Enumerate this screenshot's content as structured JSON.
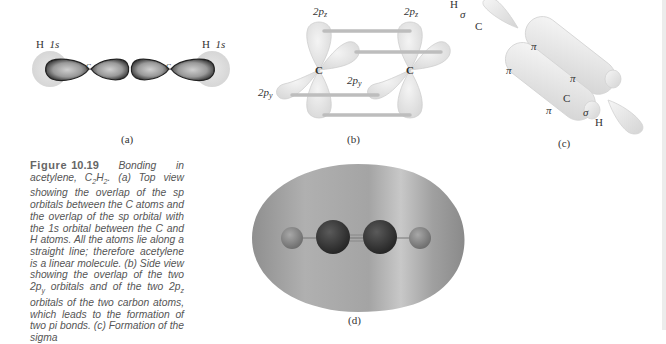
{
  "figure": {
    "number": "10.19",
    "label": "Figure",
    "caption_text": "Bonding in acetylene, C2H2. (a) Top view showing the overlap of the sp orbitals between the C atoms and the overlap of the sp orbital with the 1s orbital between the C and H atoms. All the atoms lie along a straight line; therefore acetylene is a linear molecule. (b) Side view showing the overlap of the two 2py orbitals and of the two 2pz orbitals of the two carbon atoms, which leads to the formation of two pi bonds. (c) Formation of the sigma",
    "caption_parts": {
      "intro": "Bonding in acetylene, ",
      "formula_c": "C",
      "formula_c_sub": "2",
      "formula_h": "H",
      "formula_h_sub": "2",
      "rest": ". (a) Top view showing the overlap of the sp orbitals between the C atoms and the overlap of the sp orbital with the 1s orbital between the C and H atoms. All the atoms lie along a straight line; therefore acetylene is a linear molecule. (b) Side view showing the overlap of the two 2p",
      "py_sub": "y",
      "mid": " orbitals and of the two 2p",
      "pz_sub": "z",
      "end": " orbitals of the two carbon atoms, which leads to the formation of two pi bonds. (c) Formation of the sigma"
    }
  },
  "panels": {
    "a": {
      "caption": "(a)",
      "h_left": "H",
      "h_left_orbital": "1s",
      "h_right": "H",
      "h_right_orbital": "1s",
      "c_left": "C",
      "c_right": "C"
    },
    "b": {
      "caption": "(b)",
      "pz_left": "2p",
      "pz_left_sub": "z",
      "pz_right": "2p",
      "pz_right_sub": "z",
      "py_left": "2p",
      "py_left_sub": "y",
      "py_mid": "2p",
      "py_mid_sub": "y",
      "c_left": "C",
      "c_right": "C"
    },
    "c": {
      "caption": "(c)",
      "h_top": "H",
      "sigma_top": "σ",
      "c_top": "C",
      "pi_upper": "π",
      "pi_lower": "π",
      "pi_right_small": "π",
      "pi_bottom_small": "π",
      "c_bottom": "C",
      "sigma_bottom": "σ",
      "h_bottom": "H"
    },
    "d": {
      "caption": "(d)"
    }
  },
  "colors": {
    "background": "#ffffff",
    "text": "#333333",
    "caption_text": "#555555",
    "lobe_dark": "#2a2a2a",
    "lobe_light": "#d8d8d8",
    "orbital_gray": "#e6e6e6",
    "bond_bar": "#c4c4c4",
    "surface": "#a8a8a8",
    "carbon_sphere": "#3c3c3c",
    "hydrogen_sphere": "#8e8e8e"
  }
}
